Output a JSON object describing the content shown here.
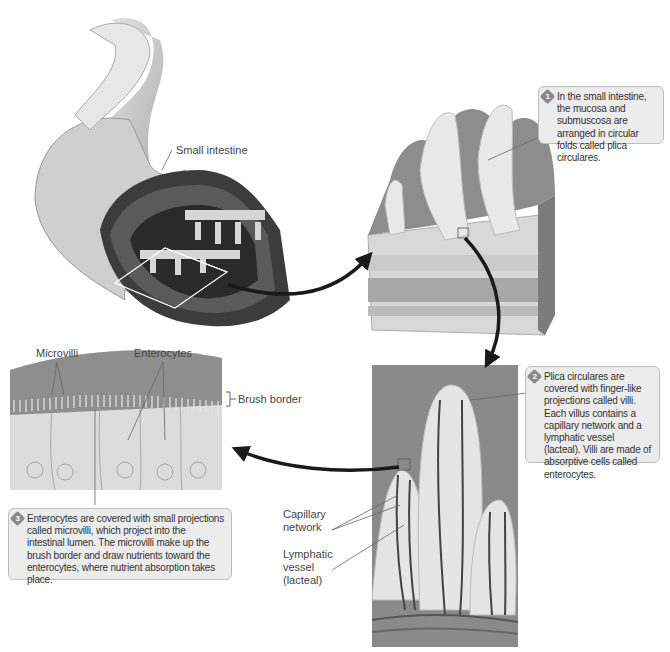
{
  "figure": {
    "panels": [
      {
        "id": "intestine",
        "label": "Small intestine"
      },
      {
        "id": "plica",
        "callout_number": "1",
        "callout": "In the small intestine, the mucosa and submuscosa are arranged in circular folds called plica circulares."
      },
      {
        "id": "villi",
        "callout_number": "2",
        "callout": "Plica circulares are covered with finger-like projections called villi. Each villus contains a capillary network and a lymphatic vessel (lacteal). Villi are made of absorptive cells called enterocytes.",
        "labels": {
          "capillary_1": "Capillary",
          "capillary_2": "network",
          "lymph_1": "Lymphatic",
          "lymph_2": "vessel",
          "lymph_3": "(lacteal)"
        }
      },
      {
        "id": "enterocytes",
        "callout_number": "3",
        "callout": "Enterocytes are covered with small projections called microvilli, which project into the intestinal lumen. The microvilli make up the brush border and draw nutrients toward the enterocytes, where nutrient absorption takes place.",
        "labels": {
          "microvilli": "Microvilli",
          "enterocytes": "Enterocytes",
          "brush_border": "Brush border"
        }
      }
    ]
  },
  "colors": {
    "callout_bg": "#ececec",
    "callout_border": "#bdbdbd",
    "badge": "#8a8a8a",
    "arrow": "#1a1a1a"
  }
}
